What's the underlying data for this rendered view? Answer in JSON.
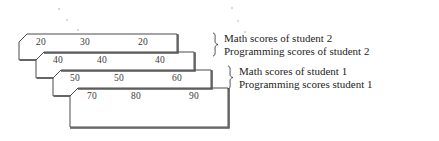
{
  "diagram": {
    "type": "stacked-2d-array-illustration",
    "stroke_color": "#4a4a4a",
    "shadow_color": "#555555",
    "fill_color": "#ffffff",
    "text_color": "#3a3a3a",
    "label_color": "#242424",
    "sheets": [
      {
        "name": "sheet-1",
        "values": [
          "20",
          "30",
          "20"
        ]
      },
      {
        "name": "sheet-2",
        "values": [
          "40",
          "40",
          "40"
        ]
      },
      {
        "name": "sheet-3",
        "values": [
          "50",
          "50",
          "60"
        ]
      },
      {
        "name": "sheet-4",
        "values": [
          "70",
          "80",
          "90"
        ]
      }
    ],
    "braces": [
      {
        "name": "brace-student-2",
        "glyph": "}"
      },
      {
        "name": "brace-student-1",
        "glyph": "}"
      }
    ],
    "labels": [
      {
        "name": "label-math-student-2",
        "text": "Math scores of student 2"
      },
      {
        "name": "label-programming-student-2",
        "text": "Programming scores of student 2"
      },
      {
        "name": "label-math-student-1",
        "text": "Math scores of student 1"
      },
      {
        "name": "label-programming-student-1",
        "text": "Programming scores student 1"
      }
    ]
  }
}
